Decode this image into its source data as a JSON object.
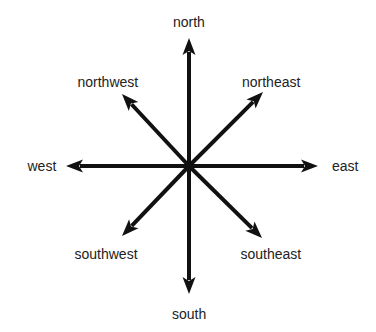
{
  "diagram": {
    "title": "",
    "type": "compass-rose",
    "center": {
      "x": 189,
      "y": 166
    },
    "stroke_color": "#111111",
    "label_color": "#222222",
    "background": "#ffffff",
    "directions": [
      {
        "key": "north",
        "label": "north",
        "tip": {
          "x": 189,
          "y": 38
        },
        "label_pos": {
          "x": 189,
          "y": 22
        }
      },
      {
        "key": "northeast",
        "label": "northeast",
        "tip": {
          "x": 263,
          "y": 92
        },
        "label_pos": {
          "x": 271,
          "y": 82
        }
      },
      {
        "key": "east",
        "label": "east",
        "tip": {
          "x": 318,
          "y": 166
        },
        "label_pos": {
          "x": 345,
          "y": 166
        }
      },
      {
        "key": "southeast",
        "label": "southeast",
        "tip": {
          "x": 262,
          "y": 238
        },
        "label_pos": {
          "x": 271,
          "y": 254
        }
      },
      {
        "key": "south",
        "label": "south",
        "tip": {
          "x": 189,
          "y": 294
        },
        "label_pos": {
          "x": 189,
          "y": 314
        }
      },
      {
        "key": "southwest",
        "label": "southwest",
        "tip": {
          "x": 122,
          "y": 236
        },
        "label_pos": {
          "x": 106,
          "y": 254
        }
      },
      {
        "key": "west",
        "label": "west",
        "tip": {
          "x": 66,
          "y": 166
        },
        "label_pos": {
          "x": 42,
          "y": 166
        }
      },
      {
        "key": "northwest",
        "label": "northwest",
        "tip": {
          "x": 122,
          "y": 94
        },
        "label_pos": {
          "x": 108,
          "y": 82
        }
      }
    ]
  }
}
